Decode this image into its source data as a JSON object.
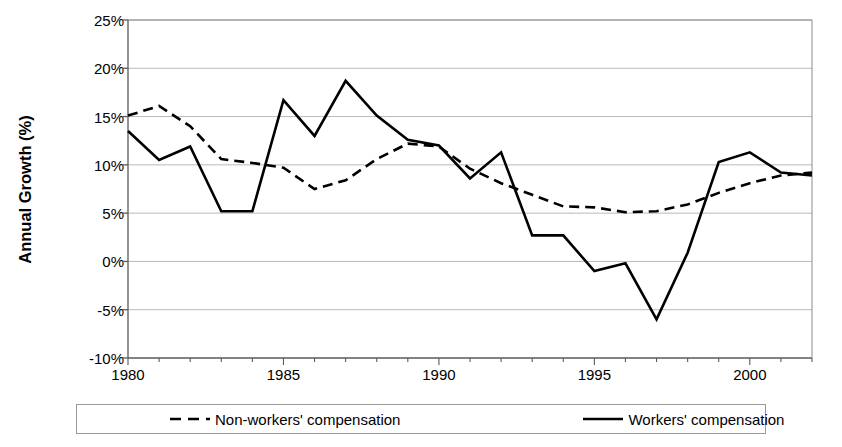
{
  "chart_data": {
    "type": "line",
    "title": "",
    "xlabel": "",
    "ylabel": "Annual Growth (%)",
    "xlim": [
      1980,
      2002
    ],
    "ylim": [
      -10,
      25
    ],
    "ytick_step": 5,
    "grid": true,
    "legend_position": "bottom",
    "x": [
      1980,
      1981,
      1982,
      1983,
      1984,
      1985,
      1986,
      1987,
      1988,
      1989,
      1990,
      1991,
      1992,
      1993,
      1994,
      1995,
      1996,
      1997,
      1998,
      1999,
      2000,
      2001,
      2002
    ],
    "xticks": [
      1980,
      1985,
      1990,
      1995,
      2000
    ],
    "xtick_labels": [
      "1980",
      "1985",
      "1990",
      "1995",
      "2000"
    ],
    "xticks_minor": [
      1981,
      1982,
      1983,
      1984,
      1986,
      1987,
      1988,
      1989,
      1991,
      1992,
      1993,
      1994,
      1996,
      1997,
      1998,
      1999,
      2001,
      2002
    ],
    "yticks": [
      -10,
      -5,
      0,
      5,
      10,
      15,
      20,
      25
    ],
    "ytick_labels": [
      "-10%",
      "-5%",
      "0%",
      "5%",
      "10%",
      "15%",
      "20%",
      "25%"
    ],
    "series": [
      {
        "name": "Non-workers' compensation",
        "style": "dashed",
        "color": "#000000",
        "values": [
          15.1,
          16.1,
          14.0,
          10.6,
          10.2,
          9.7,
          7.5,
          8.4,
          10.6,
          12.2,
          11.9,
          9.6,
          8.1,
          6.9,
          5.7,
          5.6,
          5.1,
          5.2,
          5.9,
          7.1,
          8.1,
          8.9,
          9.2
        ]
      },
      {
        "name": "Workers' compensation",
        "style": "solid",
        "color": "#000000",
        "values": [
          13.5,
          10.5,
          11.9,
          5.2,
          5.2,
          16.7,
          13.0,
          18.7,
          15.1,
          12.6,
          12.0,
          8.6,
          11.3,
          2.7,
          2.7,
          -1.0,
          -0.2,
          -6.0,
          0.9,
          10.3,
          11.3,
          9.2,
          8.9
        ]
      }
    ]
  },
  "legend": {
    "items": [
      {
        "label": "Non-workers' compensation",
        "style": "dashed"
      },
      {
        "label": "Workers' compensation",
        "style": "solid"
      }
    ]
  },
  "axis": {
    "y_title": "Annual Growth (%)"
  }
}
